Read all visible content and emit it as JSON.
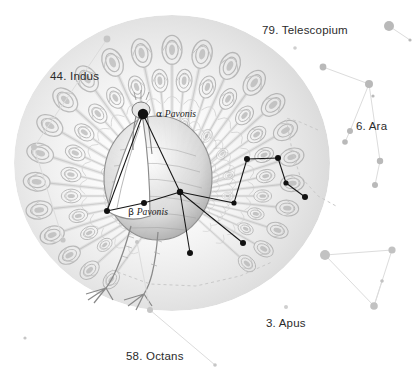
{
  "plate": {
    "title": "Pavo — the Peacock",
    "background_color": "#ffffff",
    "ink_color": "#8a8a8a",
    "label_color": "#2b2b2b",
    "bright_star_color": "#111111",
    "faint_star_color": "#b9b9b9"
  },
  "constellation_labels": [
    {
      "id": "telescopium",
      "text": "79. Telescopium",
      "x": 262,
      "y": 24
    },
    {
      "id": "indus",
      "text": "44. Indus",
      "x": 50,
      "y": 70
    },
    {
      "id": "ara",
      "text": "6. Ara",
      "x": 356,
      "y": 120
    },
    {
      "id": "apus",
      "text": "3. Apus",
      "x": 266,
      "y": 317
    },
    {
      "id": "octans",
      "text": "58. Octans",
      "x": 126,
      "y": 350
    }
  ],
  "star_labels": [
    {
      "id": "alpha-pavonis",
      "greek": "α",
      "name": "Pavonis",
      "x": 156,
      "y": 108
    },
    {
      "id": "beta-pavonis",
      "greek": "β",
      "name": "Pavonis",
      "x": 128,
      "y": 206
    }
  ],
  "chart_data": {
    "type": "scatter",
    "xlabel": "",
    "ylabel": "",
    "xlim": [
      0,
      420
    ],
    "ylim": [
      0,
      387
    ],
    "grid": false,
    "legend": null,
    "series": [
      {
        "name": "Pavo bright stars",
        "color": "#111111",
        "points": [
          {
            "id": "alpha-pav",
            "label": "α Pavonis",
            "x": 143,
            "y": 114,
            "r": 5.2
          },
          {
            "id": "beta-pav",
            "label": "β Pavonis",
            "x": 144,
            "y": 203,
            "r": 3.0
          },
          {
            "id": "pav-delta",
            "label": "",
            "x": 107,
            "y": 211,
            "r": 3.0
          },
          {
            "id": "pav-hub",
            "label": "",
            "x": 180,
            "y": 192,
            "r": 3.2
          },
          {
            "id": "pav-e1",
            "label": "",
            "x": 247,
            "y": 159,
            "r": 3.0
          },
          {
            "id": "pav-e2",
            "label": "",
            "x": 278,
            "y": 158,
            "r": 3.0
          },
          {
            "id": "pav-e3",
            "label": "",
            "x": 286,
            "y": 183,
            "r": 2.6
          },
          {
            "id": "pav-e4",
            "label": "",
            "x": 305,
            "y": 197,
            "r": 3.0
          },
          {
            "id": "pav-e5",
            "label": "",
            "x": 234,
            "y": 203,
            "r": 2.6
          },
          {
            "id": "pav-s1",
            "label": "",
            "x": 243,
            "y": 243,
            "r": 3.0
          },
          {
            "id": "pav-s2",
            "label": "",
            "x": 190,
            "y": 253,
            "r": 3.0
          }
        ],
        "links": [
          [
            "alpha-pav",
            "pav-delta"
          ],
          [
            "alpha-pav",
            "pav-hub"
          ],
          [
            "pav-delta",
            "beta-pav"
          ],
          [
            "beta-pav",
            "pav-hub"
          ],
          [
            "pav-hub",
            "pav-e5"
          ],
          [
            "pav-e5",
            "pav-e1"
          ],
          [
            "pav-e1",
            "pav-e2"
          ],
          [
            "pav-e2",
            "pav-e3"
          ],
          [
            "pav-e3",
            "pav-e4"
          ],
          [
            "pav-hub",
            "pav-s1"
          ],
          [
            "pav-hub",
            "pav-s2"
          ]
        ]
      },
      {
        "name": "Ara (faint)",
        "color": "#b9b9b9",
        "points": [
          {
            "id": "ara-1",
            "label": "",
            "x": 389,
            "y": 26,
            "r": 5.0
          },
          {
            "id": "ara-2",
            "label": "",
            "x": 323,
            "y": 67,
            "r": 3.4
          },
          {
            "id": "ara-3",
            "label": "",
            "x": 369,
            "y": 84,
            "r": 4.0
          },
          {
            "id": "ara-4",
            "label": "",
            "x": 373,
            "y": 96,
            "r": 1.6
          },
          {
            "id": "ara-5",
            "label": "",
            "x": 350,
            "y": 131,
            "r": 3.0
          },
          {
            "id": "ara-6",
            "label": "",
            "x": 345,
            "y": 142,
            "r": 2.8
          },
          {
            "id": "ara-7",
            "label": "",
            "x": 380,
            "y": 161,
            "r": 3.2
          },
          {
            "id": "ara-8",
            "label": "",
            "x": 375,
            "y": 185,
            "r": 3.0
          },
          {
            "id": "ara-9",
            "label": "",
            "x": 410,
            "y": 40,
            "r": 1.6
          }
        ],
        "links": [
          [
            "ara-1",
            "ara-9"
          ],
          [
            "ara-2",
            "ara-3"
          ],
          [
            "ara-3",
            "ara-5"
          ],
          [
            "ara-3",
            "ara-7"
          ],
          [
            "ara-5",
            "ara-6"
          ],
          [
            "ara-7",
            "ara-8"
          ]
        ]
      },
      {
        "name": "Triangulum Australe (faint)",
        "color": "#c2c2c2",
        "points": [
          {
            "id": "tra-1",
            "label": "",
            "x": 325,
            "y": 255,
            "r": 5.0
          },
          {
            "id": "tra-2",
            "label": "",
            "x": 392,
            "y": 250,
            "r": 3.6
          },
          {
            "id": "tra-3",
            "label": "",
            "x": 382,
            "y": 281,
            "r": 1.8
          },
          {
            "id": "tra-4",
            "label": "",
            "x": 374,
            "y": 306,
            "r": 3.8
          }
        ],
        "links": [
          [
            "tra-1",
            "tra-2"
          ],
          [
            "tra-2",
            "tra-4"
          ],
          [
            "tra-1",
            "tra-4"
          ],
          [
            "tra-3",
            "tra-4"
          ]
        ]
      },
      {
        "name": "Indus (faint)",
        "color": "#c6c6c6",
        "points": [
          {
            "id": "ind-1",
            "label": "",
            "x": 107,
            "y": 39,
            "r": 3.4
          },
          {
            "id": "ind-2",
            "label": "",
            "x": 34,
            "y": 147,
            "r": 3.0
          },
          {
            "id": "ind-3",
            "label": "",
            "x": 63,
            "y": 240,
            "r": 2.6
          }
        ],
        "links": [
          [
            "ind-1",
            "ind-2"
          ],
          [
            "ind-2",
            "ind-3"
          ]
        ]
      },
      {
        "name": "Octans (faint)",
        "color": "#c6c6c6",
        "points": [
          {
            "id": "oct-1",
            "label": "",
            "x": 25,
            "y": 338,
            "r": 1.6
          },
          {
            "id": "oct-2",
            "label": "",
            "x": 150,
            "y": 310,
            "r": 3.0
          },
          {
            "id": "oct-3",
            "label": "",
            "x": 137,
            "y": 242,
            "r": 2.0
          },
          {
            "id": "oct-4",
            "label": "",
            "x": 215,
            "y": 365,
            "r": 1.8
          }
        ],
        "links": [
          [
            "oct-2",
            "oct-4"
          ],
          [
            "oct-2",
            "oct-3"
          ]
        ]
      },
      {
        "name": "Telescopium / Apus (faint)",
        "color": "#cfcfcf",
        "points": [
          {
            "id": "tel-1",
            "label": "",
            "x": 295,
            "y": 48,
            "r": 1.8
          },
          {
            "id": "apu-1",
            "label": "",
            "x": 286,
            "y": 307,
            "r": 2.0
          }
        ],
        "links": []
      }
    ],
    "boundaries": [
      {
        "id": "ara-boundary",
        "points": [
          [
            318,
            130
          ],
          [
            300,
            122
          ],
          [
            286,
            118
          ],
          [
            292,
            150
          ],
          [
            300,
            176
          ],
          [
            318,
            196
          ],
          [
            336,
            206
          ]
        ]
      },
      {
        "id": "pavo-boundary",
        "points": [
          [
            112,
            270
          ],
          [
            150,
            284
          ],
          [
            196,
            286
          ],
          [
            240,
            276
          ],
          [
            272,
            262
          ]
        ]
      }
    ]
  }
}
